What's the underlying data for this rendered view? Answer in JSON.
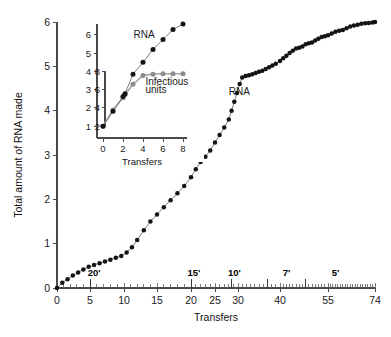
{
  "figure": {
    "background_color": "#ffffff",
    "dark_series_color": "#141414",
    "gray_series_color": "#8c8c8c",
    "axis_color": "#4a4a4a"
  },
  "chart_data": [
    {
      "id": "main",
      "type": "line",
      "title": "",
      "xlabel": "Transfers",
      "ylabel": "Total amount of RNA made",
      "grid": false,
      "legend_position": "inline-annotation",
      "xlim": [
        0,
        74
      ],
      "ylim": [
        0,
        6
      ],
      "x_tick_labels": [
        "0",
        "5",
        "10",
        "15",
        "20",
        "25",
        "30",
        "40",
        "55",
        "74"
      ],
      "x_tick_values": [
        0,
        5,
        10,
        15,
        20,
        25,
        30,
        40,
        55,
        74
      ],
      "y_tick_labels": [
        "0",
        "1",
        "2",
        "3",
        "4",
        "5",
        "6"
      ],
      "y_tick_values": [
        0,
        1,
        2,
        3,
        4,
        5,
        6
      ],
      "annotations": [
        {
          "text": "RNA",
          "x": 28,
          "y": 4.35
        },
        {
          "text": "20'",
          "x": 5.6,
          "y": 0.28
        },
        {
          "text": "15'",
          "x": 20.6,
          "y": 0.28
        },
        {
          "text": "10'",
          "x": 29.2,
          "y": 0.28
        },
        {
          "text": "7'",
          "x": 42.0,
          "y": 0.28
        },
        {
          "text": "5'",
          "x": 58.0,
          "y": 0.28
        }
      ],
      "segment_dividers": [
        5,
        20,
        28.5,
        37,
        48
      ],
      "series": [
        {
          "name": "RNA",
          "color": "#141414",
          "x": [
            0,
            0.8,
            1.6,
            2.4,
            3.2,
            4.0,
            4.8,
            5.6,
            6.4,
            7.2,
            8.0,
            8.8,
            9.6,
            10.4,
            11.2,
            12.0,
            13.0,
            14.0,
            15.0,
            16.0,
            17.0,
            18.0,
            19.0,
            20.0,
            21.0,
            22.0,
            23.0,
            24.0,
            25.0,
            26.0,
            27.0,
            28.0,
            28.6,
            29.2,
            29.8,
            30.4,
            31.0,
            31.8,
            32.6,
            33.4,
            34.2,
            35.0,
            35.8,
            36.6,
            37.4,
            38.2,
            39.0,
            40.0,
            41.0,
            42.0,
            43.0,
            44.0,
            45.0,
            46.0,
            47.0,
            48.0,
            49.0,
            50.0,
            51.0,
            52.0,
            53.0,
            54.0,
            55.0,
            56.5,
            58.0,
            59.5,
            61.0,
            62.5,
            64.0,
            65.5,
            67.0,
            68.5,
            70.0,
            71.5,
            73.0,
            74.0
          ],
          "y": [
            0.0,
            0.12,
            0.2,
            0.28,
            0.35,
            0.42,
            0.48,
            0.52,
            0.56,
            0.6,
            0.64,
            0.68,
            0.72,
            0.8,
            0.92,
            1.08,
            1.3,
            1.5,
            1.66,
            1.82,
            1.98,
            2.14,
            2.3,
            2.5,
            2.68,
            2.84,
            2.96,
            3.1,
            3.28,
            3.45,
            3.62,
            3.8,
            4.0,
            4.2,
            4.4,
            4.6,
            4.75,
            4.78,
            4.8,
            4.82,
            4.85,
            4.88,
            4.9,
            4.94,
            4.98,
            5.02,
            5.06,
            5.12,
            5.18,
            5.24,
            5.3,
            5.35,
            5.4,
            5.42,
            5.45,
            5.5,
            5.52,
            5.54,
            5.58,
            5.62,
            5.66,
            5.68,
            5.7,
            5.74,
            5.78,
            5.8,
            5.82,
            5.86,
            5.9,
            5.92,
            5.94,
            5.96,
            5.97,
            5.98,
            5.99,
            6.0
          ]
        }
      ]
    },
    {
      "id": "inset",
      "type": "line",
      "title": "",
      "xlabel": "Transfers",
      "ylabel": "",
      "grid": false,
      "legend_position": "inline-annotation",
      "xlim": [
        -0.6,
        8.4
      ],
      "ylim_outer": [
        0.35,
        6.6
      ],
      "ylim_inner": [
        1.2,
        9.0
      ],
      "x_tick_labels": [
        "0",
        "2",
        "4",
        "6",
        "8"
      ],
      "x_tick_values": [
        0,
        2,
        4,
        6,
        8
      ],
      "y_tick_labels_outer": [
        "1",
        "2",
        "3",
        "4",
        "5",
        "6"
      ],
      "y_tick_values_outer": [
        1,
        2,
        3,
        4,
        5,
        6
      ],
      "y_tick_labels_inner": [
        "2",
        "4",
        "6",
        "8"
      ],
      "y_tick_values_inner": [
        2,
        4,
        6,
        8
      ],
      "annotations": [
        {
          "text": "RNA",
          "x": 3.05,
          "y": 5.85
        },
        {
          "text": "Infectious",
          "x": 4.25,
          "y": 3.28
        },
        {
          "text": "units",
          "x": 4.25,
          "y": 2.82
        }
      ],
      "series": [
        {
          "name": "RNA",
          "color": "#141414",
          "axis": "outer",
          "x": [
            0,
            1,
            2,
            2.2,
            3,
            4,
            5,
            6,
            7,
            8
          ],
          "y": [
            1.0,
            1.82,
            2.62,
            2.78,
            3.85,
            4.5,
            5.2,
            5.75,
            6.3,
            6.6
          ]
        },
        {
          "name": "Infectious units",
          "color": "#8c8c8c",
          "axis": "inner",
          "x": [
            0,
            1,
            2,
            2.2,
            3,
            4,
            5,
            6,
            7,
            8
          ],
          "y_outer_equiv": [
            1.0,
            1.88,
            2.55,
            2.72,
            3.3,
            3.78,
            3.85,
            3.87,
            3.87,
            3.87
          ]
        }
      ]
    }
  ]
}
